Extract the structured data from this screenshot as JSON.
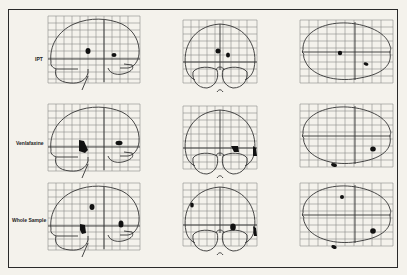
{
  "figure": {
    "views": [
      "sagittal",
      "coronal",
      "axial"
    ],
    "rows": [
      {
        "label": "IPT"
      },
      {
        "label": "Venlafaxine"
      },
      {
        "label": "Whole Sample"
      }
    ]
  }
}
